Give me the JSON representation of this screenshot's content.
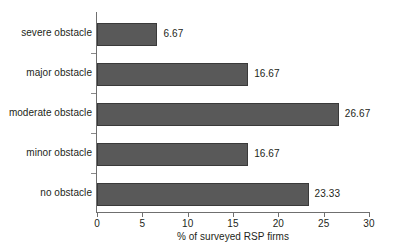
{
  "chart_data": {
    "type": "bar",
    "orientation": "horizontal",
    "title": "",
    "subtitle": "",
    "xlabel": "% of surveyed RSP firms",
    "ylabel": "",
    "categories": [
      "no obstacle",
      "minor obstacle",
      "moderate obstacle",
      "major obstacle",
      "severe obstacle"
    ],
    "values": [
      23.33,
      16.67,
      26.67,
      16.67,
      6.67
    ],
    "value_labels": [
      "23.33",
      "16.67",
      "26.67",
      "16.67",
      "6.67"
    ],
    "xlim": [
      0,
      30
    ],
    "xticks": [
      0,
      5,
      10,
      15,
      20,
      25,
      30
    ],
    "xtick_labels": [
      "0",
      "5",
      "10",
      "15",
      "20",
      "25",
      "30"
    ],
    "grid": false,
    "legend": false,
    "legend_position": "none",
    "bar_color": "#595959",
    "bar_edge_color": "#3a3a3a",
    "axis_color": "#6f6f6f",
    "text_color": "#231f20",
    "background_color": "#ffffff"
  }
}
